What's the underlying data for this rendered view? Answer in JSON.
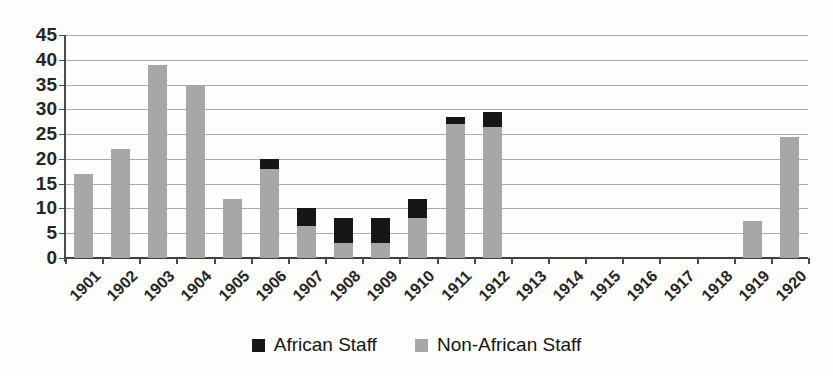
{
  "chart_data": {
    "type": "bar",
    "stacked": true,
    "title": "",
    "xlabel": "",
    "ylabel": "",
    "ylim": [
      0,
      45
    ],
    "ytick_step": 5,
    "grid": true,
    "legend_position": "bottom",
    "categories": [
      "1901",
      "1902",
      "1903",
      "1904",
      "1905",
      "1906",
      "1907",
      "1908",
      "1909",
      "1910",
      "1911",
      "1912",
      "1913",
      "1914",
      "1915",
      "1916",
      "1917",
      "1918",
      "1919",
      "1920"
    ],
    "series": [
      {
        "name": "African Staff",
        "color": "#161616",
        "values": [
          0,
          0,
          0,
          0,
          0,
          2,
          3.5,
          5,
          5,
          4,
          1.5,
          3,
          0,
          0,
          0,
          0,
          0,
          0,
          0,
          0
        ]
      },
      {
        "name": "Non-African Staff",
        "color": "#a7a7a7",
        "values": [
          17,
          22,
          39,
          35,
          12,
          18,
          6.5,
          3,
          3,
          8,
          27,
          26.5,
          0,
          0,
          0,
          0,
          0,
          0,
          7.5,
          24.5
        ]
      }
    ]
  }
}
